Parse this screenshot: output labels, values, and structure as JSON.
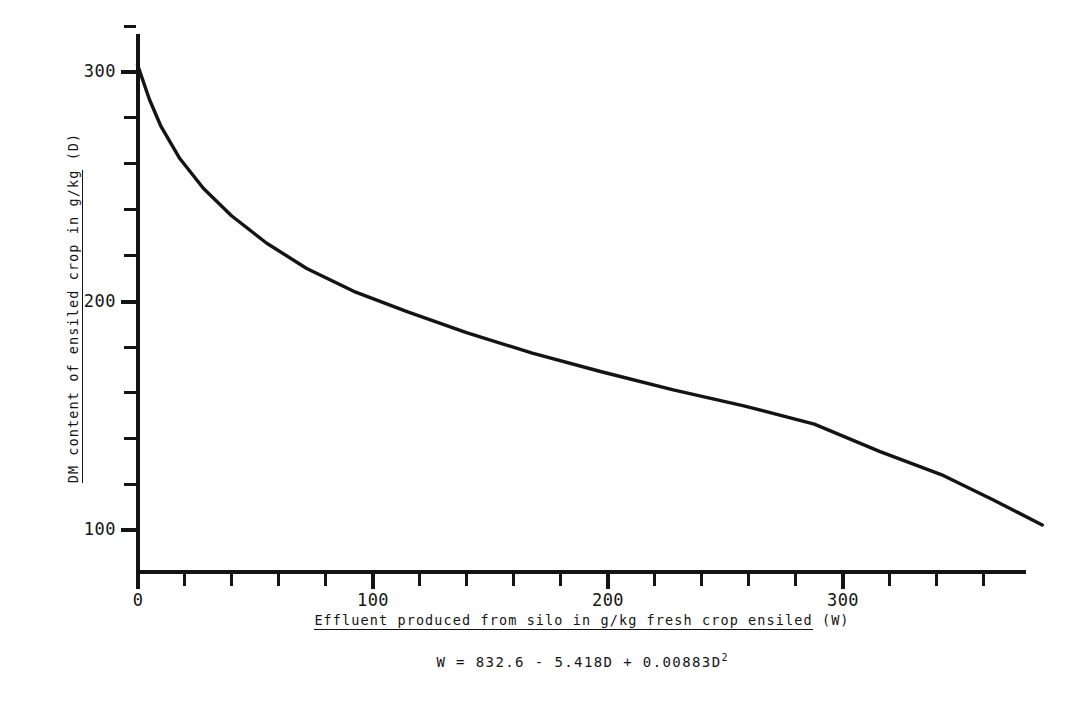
{
  "chart_data": {
    "type": "line",
    "title": "",
    "subtitle": "",
    "xlabel": "Effluent produced from silo in g/kg fresh crop ensiled (W)",
    "xlabel_underlined": "Effluent produced from silo in g/kg fresh crop ensiled",
    "xlabel_suffix": " (W)",
    "ylabel": "DM content of ensiled crop in g/kg (D)",
    "ylabel_underlined": "DM content of ensiled crop in g/kg",
    "ylabel_suffix": " (D)",
    "equation": "W = 832.6 - 5.418D + 0.00883D",
    "equation_exponent": "2",
    "equation_full": "W = 832.6 - 5.418D + 0.00883D²",
    "grid": false,
    "legend": null,
    "legend_position": "none",
    "line_color": "#141414",
    "background_color": "#ffffff",
    "xlim": [
      0,
      378
    ],
    "ylim": [
      60,
      320
    ],
    "x_major_ticks": [
      0,
      100,
      200,
      300
    ],
    "x_major_tick_labels": [
      "0",
      "100",
      "200",
      "300"
    ],
    "x_minor_tick_interval": 20,
    "y_major_ticks": [
      100,
      200,
      300
    ],
    "y_major_tick_labels": [
      "100",
      "200",
      "300"
    ],
    "y_minor_tick_interval": 20,
    "series": [
      {
        "name": "W vs D",
        "x": [
          0,
          5,
          10,
          18,
          28,
          40,
          55,
          72,
          92,
          115,
          140,
          168,
          197,
          228,
          258,
          288,
          316,
          342,
          364,
          385
        ],
        "y": [
          303,
          288,
          276,
          262,
          249,
          237,
          225,
          214,
          204,
          195,
          186,
          177,
          169,
          161,
          154,
          146,
          134,
          124,
          113,
          102
        ]
      }
    ],
    "data_points_note": "Curve of D (DM content, y) against W (effluent, x); monotonically decreasing, steep near W=0 then near-linear."
  },
  "axes": {
    "y_ticks_major": [
      {
        "value": 300,
        "label": "300"
      },
      {
        "value": 200,
        "label": "200"
      },
      {
        "value": 100,
        "label": "100"
      }
    ],
    "y_ticks_minor": [
      320,
      280,
      260,
      240,
      220,
      180,
      160,
      140,
      120,
      80
    ],
    "x_ticks_major": [
      {
        "value": 0,
        "label": "0"
      },
      {
        "value": 100,
        "label": "100"
      },
      {
        "value": 200,
        "label": "200"
      },
      {
        "value": 300,
        "label": "300"
      }
    ],
    "x_ticks_minor": [
      20,
      40,
      60,
      80,
      120,
      140,
      160,
      180,
      220,
      240,
      260,
      280,
      320,
      340,
      360
    ]
  }
}
